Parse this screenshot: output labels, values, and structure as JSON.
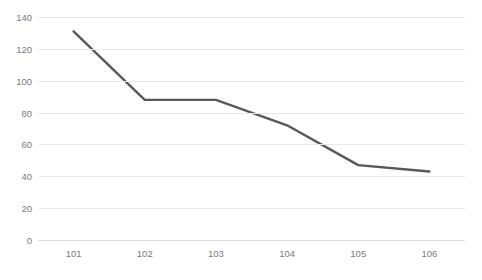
{
  "chart_data": {
    "type": "line",
    "title": "",
    "subtitle": "",
    "xlabel": "",
    "ylabel": "",
    "categories": [
      "101",
      "102",
      "103",
      "104",
      "105",
      "106"
    ],
    "values": [
      131,
      88,
      88,
      72,
      47,
      43
    ],
    "series": [
      {
        "name": "",
        "values": [
          131,
          88,
          88,
          72,
          47,
          43
        ]
      }
    ],
    "ylim": [
      0,
      140
    ],
    "y_ticks": [
      0,
      20,
      40,
      60,
      80,
      100,
      120,
      140
    ],
    "y_tick_labels": [
      "0",
      "20",
      "40",
      "60",
      "80",
      "100",
      "120",
      "140"
    ],
    "grid": true,
    "grid_axis": "y",
    "legend": false,
    "legend_position": "none",
    "markers": false,
    "line_color": "#595959",
    "line_width": 2.4,
    "grid_color": "#e8e8e8",
    "tick_label_color": "#7a7a7a",
    "background_color": "#ffffff",
    "annotations": []
  },
  "clipped_title_text": ""
}
